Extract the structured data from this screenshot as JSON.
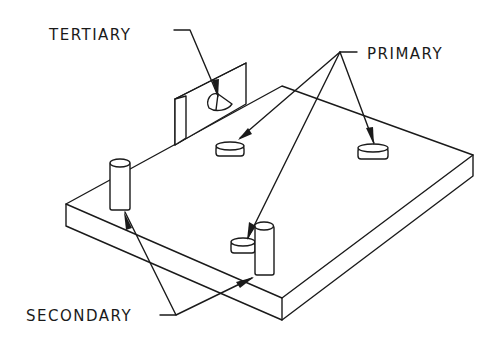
{
  "diagram": {
    "colors": {
      "line": "#1a1a1a",
      "background": "#ffffff"
    },
    "labels": {
      "tertiary": "TERTIARY",
      "primary": "PRIMARY",
      "secondary": "SECONDARY"
    },
    "components": [
      {
        "name": "base-plate",
        "type": "rectangular plate"
      },
      {
        "name": "tertiary-wall",
        "type": "vertical wall with half-round locator"
      },
      {
        "name": "primary-locator-1",
        "type": "button pad"
      },
      {
        "name": "primary-locator-2",
        "type": "button pad"
      },
      {
        "name": "primary-locator-3",
        "type": "button pad"
      },
      {
        "name": "secondary-pin-1",
        "type": "cylindrical pin"
      },
      {
        "name": "secondary-pin-2",
        "type": "cylindrical pin"
      }
    ]
  }
}
